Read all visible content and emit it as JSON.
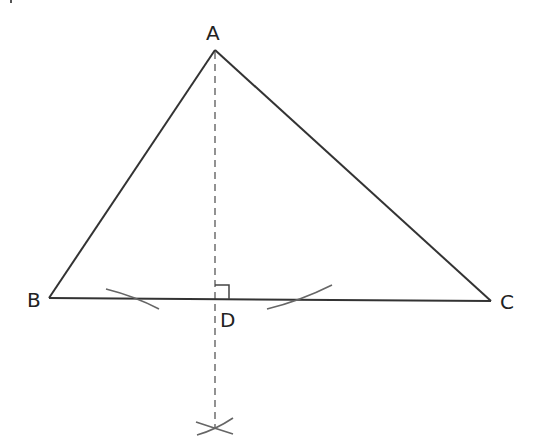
{
  "diagram": {
    "title": "",
    "colors": {
      "line": "#333333",
      "dashed": "#777777",
      "arc": "#666666",
      "label": "#222222",
      "background": "#ffffff"
    },
    "points": {
      "A": {
        "label": "A",
        "x": 215,
        "y": 50
      },
      "B": {
        "label": "B",
        "x": 49,
        "y": 298
      },
      "C": {
        "label": "C",
        "x": 491,
        "y": 301
      },
      "D": {
        "label": "D",
        "x": 215,
        "y": 299
      }
    },
    "labels": [
      {
        "id": "A",
        "text": "A"
      },
      {
        "id": "B",
        "text": "B"
      },
      {
        "id": "C",
        "text": "C"
      },
      {
        "id": "D",
        "text": "D"
      }
    ],
    "segments": [
      {
        "from": "A",
        "to": "B",
        "style": "solid"
      },
      {
        "from": "A",
        "to": "C",
        "style": "solid"
      },
      {
        "from": "B",
        "to": "C",
        "style": "solid"
      },
      {
        "from": "A",
        "to": "D",
        "style": "dashed",
        "extends_below_to_y": 428
      }
    ],
    "annotations": [
      {
        "type": "right-angle",
        "at": "D"
      },
      {
        "type": "construction-arc",
        "near": "BC-left"
      },
      {
        "type": "construction-arc",
        "near": "BC-right"
      },
      {
        "type": "construction-arcs-intersection",
        "near": "below-D"
      }
    ]
  }
}
